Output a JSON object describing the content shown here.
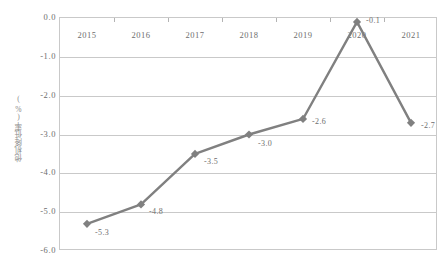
{
  "chart_data": {
    "type": "line",
    "title": "",
    "xlabel": "",
    "ylabel": "他机降低率(%)",
    "categories": [
      "2015",
      "2016",
      "2017",
      "2018",
      "2019",
      "2020",
      "2021"
    ],
    "values": [
      -5.3,
      -4.8,
      -3.5,
      -3.0,
      -2.6,
      -0.1,
      -2.7
    ],
    "point_labels": [
      "-5.3",
      "-4.8",
      "-3.5",
      "-3.0",
      "-2.6",
      "-0.1",
      "-2.7"
    ],
    "ylim": [
      -6.0,
      0.0
    ],
    "ytick_labels": [
      "0.0",
      "-1.0",
      "-2.0",
      "-3.0",
      "-4.0",
      "-5.0",
      "-6.0"
    ],
    "ytick_values": [
      0.0,
      -1.0,
      -2.0,
      -3.0,
      -4.0,
      -5.0,
      -6.0
    ],
    "grid": true,
    "legend": "none",
    "series_color": "#808080",
    "grid_color": "#c9c9c9",
    "text_color": "#6e6e6e",
    "marker": "diamond",
    "xaxis_position": "top"
  }
}
